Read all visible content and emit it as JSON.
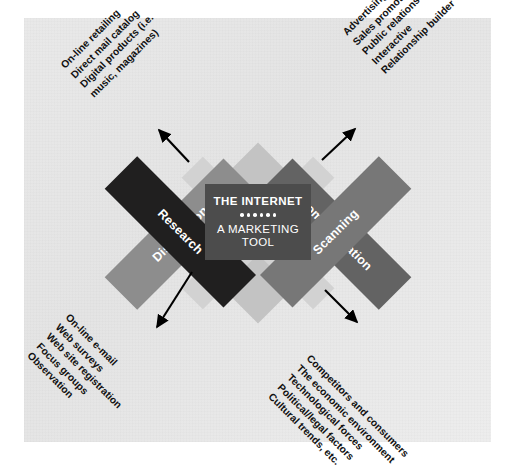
{
  "figure": {
    "center": {
      "title": "THE INTERNET",
      "subtitle_line1": "A MARKETING",
      "subtitle_line2": "TOOL",
      "divider_dot_count": 6
    },
    "quadrants": [
      {
        "id": "distribution",
        "label": "Distribution",
        "color": "#8d8d8d",
        "position": "upper-left",
        "arrow_direction": "up-left",
        "notes": [
          "On-line retailing",
          "Direct mail catalog",
          "Digital products (i.e.",
          "music, magazines)"
        ]
      },
      {
        "id": "communication",
        "label": "Communication",
        "color": "#636363",
        "position": "upper-right",
        "arrow_direction": "up-right",
        "notes": [
          "Advertising",
          "Sales promotion",
          "Public relations",
          "Interactive",
          "Relationship builder"
        ]
      },
      {
        "id": "research",
        "label": "Research",
        "color": "#201f1f",
        "position": "lower-left",
        "arrow_direction": "down-left",
        "notes": [
          "On-line e-mail",
          "Web surveys",
          "Web site registration",
          "Focus groups",
          "Observation"
        ]
      },
      {
        "id": "scanning",
        "label": "Scanning",
        "color": "#777777",
        "position": "lower-right",
        "arrow_direction": "down-right",
        "notes": [
          "Competitors and consumers",
          "The economic environment",
          "Technological forces",
          "Political/legal factors",
          "Cultural trends, etc."
        ]
      }
    ],
    "colors": {
      "background": "#ffffff",
      "panel": "#e8e8e8",
      "inner_diamond": "#c3c3c3",
      "inner_cross": "#d2d2d2",
      "center_box": "#4c4c4c",
      "center_text": "#ffffff",
      "arrow": "#000000",
      "note_text": "#111111"
    }
  }
}
